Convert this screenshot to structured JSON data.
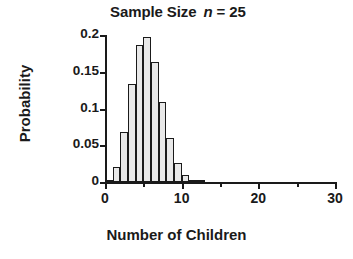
{
  "chart_data": {
    "type": "bar",
    "title_prefix": "Sample Size",
    "title_variable": "n",
    "title_equals": "= 25",
    "xlabel": "Number of Children",
    "ylabel": "Probability",
    "xlim": [
      0,
      30
    ],
    "ylim": [
      0,
      0.2
    ],
    "grid": false,
    "legend": null,
    "x_major_ticks": [
      0,
      10,
      20,
      30
    ],
    "x_minor_ticks": [
      5,
      15,
      25
    ],
    "x_tick_labels": [
      "0",
      "10",
      "20",
      "30"
    ],
    "y_ticks": [
      0,
      0.05,
      0.1,
      0.15,
      0.2
    ],
    "y_tick_labels": [
      "0",
      "0.05",
      "0.1",
      "0.15",
      "0.2"
    ],
    "bar_fill_color": "#e8e8e8",
    "bar_edge_color": "#1a1a1a",
    "categories": [
      0,
      1,
      2,
      3,
      4,
      5,
      6,
      7,
      8,
      9,
      10,
      11,
      12
    ],
    "values": [
      0.002,
      0.021,
      0.068,
      0.134,
      0.187,
      0.197,
      0.163,
      0.109,
      0.06,
      0.026,
      0.01,
      0.003,
      0.001
    ],
    "bars": [
      {
        "x": 0,
        "value": 0.002
      },
      {
        "x": 1,
        "value": 0.021
      },
      {
        "x": 2,
        "value": 0.068
      },
      {
        "x": 3,
        "value": 0.134
      },
      {
        "x": 4,
        "value": 0.187
      },
      {
        "x": 5,
        "value": 0.197
      },
      {
        "x": 6,
        "value": 0.163
      },
      {
        "x": 7,
        "value": 0.109
      },
      {
        "x": 8,
        "value": 0.06
      },
      {
        "x": 9,
        "value": 0.026
      },
      {
        "x": 10,
        "value": 0.01
      },
      {
        "x": 11,
        "value": 0.003
      },
      {
        "x": 12,
        "value": 0.001
      }
    ]
  }
}
